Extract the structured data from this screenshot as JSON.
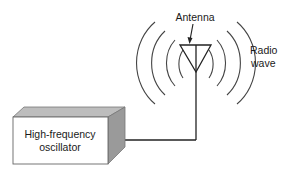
{
  "diagram": {
    "type": "schematic",
    "labels": {
      "antenna": "Antenna",
      "radio_wave_line1": "Radio",
      "radio_wave_line2": "wave",
      "oscillator_line1": "High-frequency",
      "oscillator_line2": "oscillator"
    },
    "components": [
      {
        "id": "oscillator",
        "label": "High-frequency oscillator",
        "shape": "3d-box"
      },
      {
        "id": "antenna",
        "label": "Antenna",
        "shape": "inverted-triangle"
      },
      {
        "id": "radio-wave",
        "label": "Radio wave",
        "shape": "concentric-arcs",
        "arcs_per_side": 4
      }
    ],
    "connections": [
      {
        "from": "oscillator",
        "to": "antenna",
        "kind": "wire"
      }
    ],
    "colors": {
      "line": "#222222",
      "box_front": "#ffffff",
      "box_top": "#bdbdbd",
      "box_side": "#9a9a9a",
      "arcs": "#444444"
    }
  }
}
